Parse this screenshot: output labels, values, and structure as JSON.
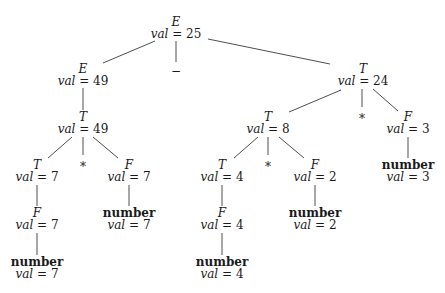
{
  "diagram": {
    "type": "annotated-parse-tree",
    "val_label": "val",
    "nodes": [
      {
        "id": "n0",
        "symbol": "E",
        "terminal": false,
        "val": "25",
        "x": 176,
        "y": 17
      },
      {
        "id": "n1",
        "symbol": "E",
        "terminal": false,
        "val": "49",
        "x": 83,
        "y": 64
      },
      {
        "id": "n2",
        "symbol": "−",
        "token": true,
        "x": 176,
        "y": 64
      },
      {
        "id": "n3",
        "symbol": "T",
        "terminal": false,
        "val": "24",
        "x": 363,
        "y": 64
      },
      {
        "id": "n4",
        "symbol": "T",
        "terminal": false,
        "val": "49",
        "x": 83,
        "y": 112
      },
      {
        "id": "n5",
        "symbol": "T",
        "terminal": false,
        "val": "8",
        "x": 268,
        "y": 112
      },
      {
        "id": "n6",
        "symbol": "*",
        "token": true,
        "x": 362,
        "y": 112
      },
      {
        "id": "n7",
        "symbol": "F",
        "terminal": false,
        "val": "3",
        "x": 408,
        "y": 112
      },
      {
        "id": "n8",
        "symbol": "T",
        "terminal": false,
        "val": "7",
        "x": 37,
        "y": 160
      },
      {
        "id": "n9",
        "symbol": "*",
        "token": true,
        "x": 83,
        "y": 160
      },
      {
        "id": "n10",
        "symbol": "F",
        "terminal": false,
        "val": "7",
        "x": 129,
        "y": 160
      },
      {
        "id": "n11",
        "symbol": "T",
        "terminal": false,
        "val": "4",
        "x": 222,
        "y": 160
      },
      {
        "id": "n12",
        "symbol": "*",
        "token": true,
        "x": 268,
        "y": 160
      },
      {
        "id": "n13",
        "symbol": "F",
        "terminal": false,
        "val": "2",
        "x": 315,
        "y": 160
      },
      {
        "id": "n14",
        "symbol": "number",
        "terminal": true,
        "val": "3",
        "x": 408,
        "y": 160
      },
      {
        "id": "n15",
        "symbol": "F",
        "terminal": false,
        "val": "7",
        "x": 37,
        "y": 208
      },
      {
        "id": "n16",
        "symbol": "number",
        "terminal": true,
        "val": "7",
        "x": 129,
        "y": 208
      },
      {
        "id": "n17",
        "symbol": "F",
        "terminal": false,
        "val": "4",
        "x": 222,
        "y": 208
      },
      {
        "id": "n18",
        "symbol": "number",
        "terminal": true,
        "val": "2",
        "x": 315,
        "y": 208
      },
      {
        "id": "n19",
        "symbol": "number",
        "terminal": true,
        "val": "7",
        "x": 37,
        "y": 257
      },
      {
        "id": "n20",
        "symbol": "number",
        "terminal": true,
        "val": "4",
        "x": 222,
        "y": 257
      }
    ],
    "edges": [
      {
        "from": "n0",
        "to": "n1",
        "x1": 155,
        "y1": 41,
        "x2": 103,
        "y2": 63
      },
      {
        "from": "n0",
        "to": "n2",
        "x1": 176,
        "y1": 41,
        "x2": 176,
        "y2": 62
      },
      {
        "from": "n0",
        "to": "n3",
        "x1": 208,
        "y1": 39,
        "x2": 330,
        "y2": 64
      },
      {
        "from": "n1",
        "to": "n4",
        "x1": 83,
        "y1": 88,
        "x2": 83,
        "y2": 110
      },
      {
        "from": "n3",
        "to": "n5",
        "x1": 341,
        "y1": 90,
        "x2": 289,
        "y2": 112
      },
      {
        "from": "n3",
        "to": "n6",
        "x1": 362,
        "y1": 89,
        "x2": 362,
        "y2": 107
      },
      {
        "from": "n3",
        "to": "n7",
        "x1": 373,
        "y1": 89,
        "x2": 398,
        "y2": 111
      },
      {
        "from": "n4",
        "to": "n8",
        "x1": 72,
        "y1": 137,
        "x2": 48,
        "y2": 158
      },
      {
        "from": "n4",
        "to": "n9",
        "x1": 83,
        "y1": 137,
        "x2": 83,
        "y2": 155
      },
      {
        "from": "n4",
        "to": "n10",
        "x1": 93,
        "y1": 137,
        "x2": 118,
        "y2": 158
      },
      {
        "from": "n5",
        "to": "n11",
        "x1": 258,
        "y1": 137,
        "x2": 234,
        "y2": 158
      },
      {
        "from": "n5",
        "to": "n12",
        "x1": 268,
        "y1": 137,
        "x2": 268,
        "y2": 155
      },
      {
        "from": "n5",
        "to": "n13",
        "x1": 279,
        "y1": 137,
        "x2": 304,
        "y2": 158
      },
      {
        "from": "n7",
        "to": "n14",
        "x1": 408,
        "y1": 137,
        "x2": 408,
        "y2": 158
      },
      {
        "from": "n8",
        "to": "n15",
        "x1": 37,
        "y1": 185,
        "x2": 37,
        "y2": 206
      },
      {
        "from": "n10",
        "to": "n16",
        "x1": 129,
        "y1": 185,
        "x2": 129,
        "y2": 206
      },
      {
        "from": "n11",
        "to": "n17",
        "x1": 222,
        "y1": 185,
        "x2": 222,
        "y2": 206
      },
      {
        "from": "n13",
        "to": "n18",
        "x1": 315,
        "y1": 185,
        "x2": 315,
        "y2": 206
      },
      {
        "from": "n15",
        "to": "n19",
        "x1": 37,
        "y1": 233,
        "x2": 37,
        "y2": 255
      },
      {
        "from": "n17",
        "to": "n20",
        "x1": 222,
        "y1": 233,
        "x2": 222,
        "y2": 255
      }
    ]
  }
}
